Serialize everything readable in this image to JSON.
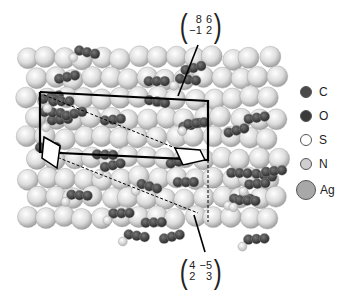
{
  "figure": {
    "top_matrix": {
      "rows": [
        [
          "8",
          "6"
        ],
        [
          "−1",
          "2"
        ]
      ]
    },
    "bottom_matrix": {
      "rows": [
        [
          "4",
          "−5"
        ],
        [
          "2",
          "3"
        ]
      ]
    },
    "legend": [
      {
        "label": "C",
        "color": "#4a4a4a",
        "size": "small"
      },
      {
        "label": "O",
        "color": "#3a3a3a",
        "size": "small"
      },
      {
        "label": "S",
        "color": "#ffffff",
        "size": "small"
      },
      {
        "label": "N",
        "color": "#cfcfcf",
        "size": "small"
      },
      {
        "label": "Ag",
        "color": "#a8a8a8",
        "size": "large"
      }
    ]
  }
}
